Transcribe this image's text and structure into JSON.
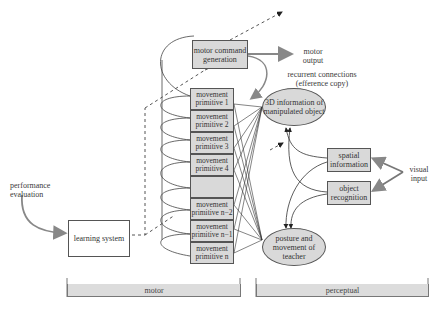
{
  "diagram": {
    "motor_command": "motor command generation",
    "motor_output": "motor output",
    "recurrent": "recurrent connections (efference copy)",
    "primitives": [
      "movement primitive 1",
      "movement primitive 2",
      "movement primitive 3",
      "movement primitive 4",
      "",
      "movement primitive n−2",
      "movement primitive n−1",
      "movement primitive n"
    ],
    "object_3d": "3D information of manipulated object",
    "posture": "posture and movement of teacher",
    "spatial": "spatial information",
    "object_recognition": "object recognition",
    "visual_input": "visual input",
    "performance": "performance evaluation",
    "learning": "learning system",
    "bars": {
      "motor": "motor",
      "perceptual": "perceptual"
    }
  }
}
